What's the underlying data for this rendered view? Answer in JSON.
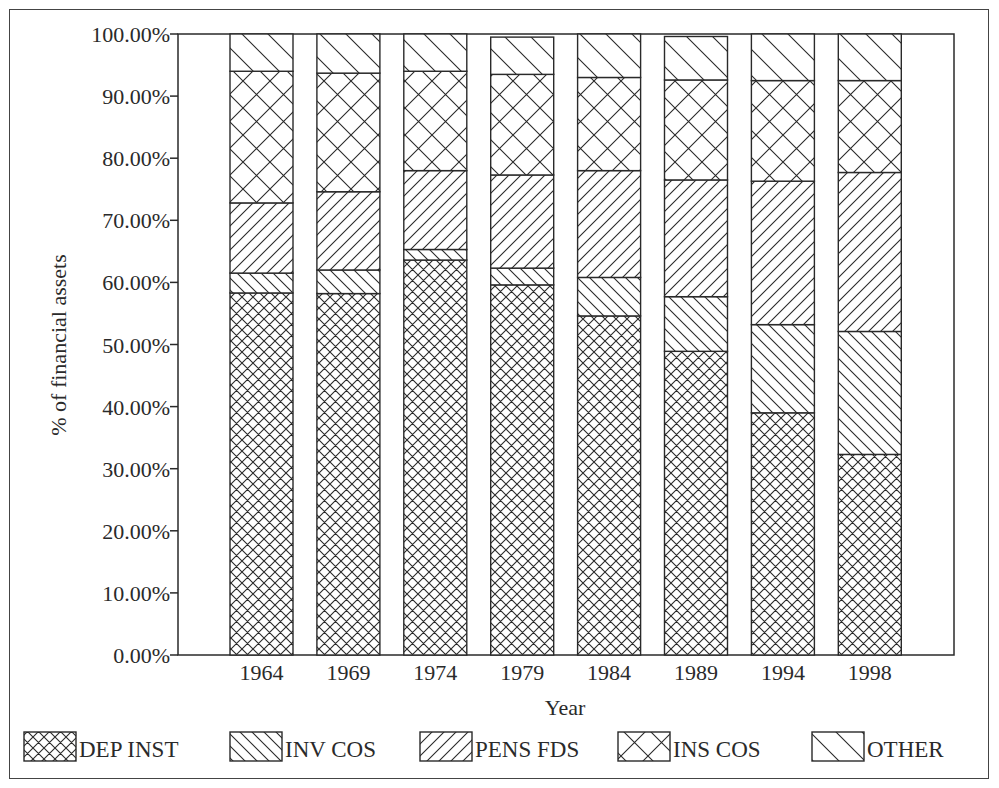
{
  "chart_data": {
    "type": "bar",
    "stacked": true,
    "normalized": true,
    "title": "",
    "xlabel": "Year",
    "ylabel": "% of financial assets",
    "ylim": [
      0,
      100
    ],
    "yticks": [
      "0.00%",
      "10.00%",
      "20.00%",
      "30.00%",
      "40.00%",
      "50.00%",
      "60.00%",
      "70.00%",
      "80.00%",
      "90.00%",
      "100.00%"
    ],
    "grid": false,
    "legend_position": "bottom",
    "categories": [
      "1964",
      "1969",
      "1974",
      "1979",
      "1984",
      "1989",
      "1994",
      "1998"
    ],
    "series": [
      {
        "name": "DEP INST",
        "pattern": "fine-crosshatch",
        "values": [
          58.3,
          58.2,
          63.6,
          59.6,
          54.6,
          48.9,
          39.0,
          32.3
        ]
      },
      {
        "name": "INV COS",
        "pattern": "back-diagonal-dense",
        "values": [
          3.2,
          3.8,
          1.7,
          2.7,
          6.2,
          8.8,
          14.2,
          19.8
        ]
      },
      {
        "name": "PENS FDS",
        "pattern": "forward-diagonal",
        "values": [
          11.3,
          12.6,
          12.7,
          15.0,
          17.2,
          18.8,
          23.1,
          25.6
        ]
      },
      {
        "name": "INS COS",
        "pattern": "coarse-crosshatch",
        "values": [
          21.2,
          19.1,
          16.0,
          16.2,
          15.0,
          16.1,
          16.2,
          14.8
        ]
      },
      {
        "name": "OTHER",
        "pattern": "back-diagonal-sparse",
        "values": [
          6.0,
          6.3,
          6.0,
          6.0,
          7.0,
          7.0,
          7.5,
          7.5
        ]
      }
    ]
  },
  "axes": {
    "x_title": "Year",
    "y_title": "% of financial assets"
  },
  "legend": {
    "items": [
      {
        "label": "DEP INST",
        "pattern": "fine-crosshatch"
      },
      {
        "label": "INV COS",
        "pattern": "back-diagonal-dense"
      },
      {
        "label": "PENS FDS",
        "pattern": "forward-diagonal"
      },
      {
        "label": "INS COS",
        "pattern": "coarse-crosshatch"
      },
      {
        "label": "OTHER",
        "pattern": "back-diagonal-sparse"
      }
    ]
  },
  "colors": {
    "ink": "#2a2a2a",
    "background": "#ffffff"
  }
}
